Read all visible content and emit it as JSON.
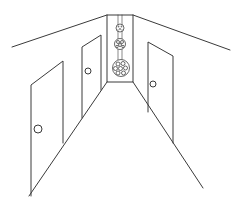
{
  "illustration": {
    "subject": "hallway-perspective-line-drawing",
    "background_color": "#ffffff",
    "line_color": "#3a3a3a",
    "doors": [
      {
        "id": "left-near-door",
        "knob": "left-side"
      },
      {
        "id": "left-far-door",
        "knob": "left-side"
      },
      {
        "id": "right-door",
        "knob": "left-side"
      }
    ],
    "lights": [
      {
        "id": "small-pendant-light",
        "size": "small"
      },
      {
        "id": "medium-pendant-light",
        "size": "medium"
      },
      {
        "id": "large-pendant-light",
        "size": "large"
      }
    ]
  }
}
